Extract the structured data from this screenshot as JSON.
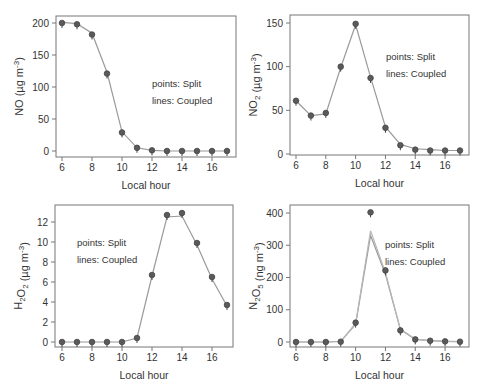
{
  "figure": {
    "layout": "2x2 grid",
    "colors": {
      "frame": "#777777",
      "text": "#333333",
      "line": "#9a9a9a",
      "point_fill": "#5a5a5a",
      "point_edge": "#444444"
    }
  },
  "chart_data": [
    {
      "id": "no",
      "type": "line",
      "title": "",
      "ylabel": "NO (µg m⁻³)",
      "ylabel_parts": {
        "species": "NO",
        "sub": "",
        "unit": " (µg m",
        "exp": "-3",
        "close": ")"
      },
      "xlabel": "Local hour",
      "x": [
        6,
        7,
        8,
        9,
        10,
        11,
        12,
        13,
        14,
        15,
        16,
        17
      ],
      "xticks": [
        6,
        8,
        10,
        12,
        14,
        16
      ],
      "yticks": [
        0,
        50,
        100,
        150,
        200
      ],
      "xlim": [
        6,
        17
      ],
      "ylim": [
        0,
        200
      ],
      "series": [
        {
          "name": "Split",
          "style": "points",
          "values": [
            200,
            198,
            182,
            121,
            29,
            5,
            1,
            0,
            0,
            0,
            0,
            0
          ]
        },
        {
          "name": "Coupled",
          "style": "lines",
          "values": [
            201,
            199,
            184,
            123,
            30,
            5,
            1,
            0,
            0,
            0,
            0,
            0
          ]
        }
      ],
      "annotations": [
        "points: Split",
        "lines: Coupled"
      ],
      "annotation_pos": {
        "x": 152,
        "y": 87
      },
      "grid": false,
      "frame": {
        "left": 56,
        "top": 16,
        "right": 236,
        "bottom": 157
      },
      "px": {
        "x0": 62,
        "x1": 227,
        "y0": 151,
        "y1": 23
      }
    },
    {
      "id": "no2",
      "type": "line",
      "title": "",
      "ylabel": "NO₂ (µg m⁻³)",
      "ylabel_parts": {
        "species": "NO",
        "sub": "2",
        "unit": " (µg m",
        "exp": "-3",
        "close": ")"
      },
      "xlabel": "Local hour",
      "x": [
        6,
        7,
        8,
        9,
        10,
        11,
        12,
        13,
        14,
        15,
        16,
        17
      ],
      "xticks": [
        6,
        8,
        10,
        12,
        14,
        16
      ],
      "yticks": [
        0,
        50,
        100,
        150
      ],
      "xlim": [
        6,
        17
      ],
      "ylim": [
        0,
        150
      ],
      "series": [
        {
          "name": "Split",
          "style": "points",
          "values": [
            61,
            44,
            47,
            100,
            149,
            87,
            30,
            10,
            5,
            4,
            4,
            4
          ]
        },
        {
          "name": "Coupled",
          "style": "lines",
          "values": [
            61,
            44,
            46,
            99,
            148,
            88,
            31,
            11,
            6,
            5,
            4,
            4
          ]
        }
      ],
      "annotations": [
        "points: Split",
        "lines: Coupled"
      ],
      "annotation_pos": {
        "x": 386,
        "y": 60
      },
      "grid": false,
      "frame": {
        "left": 290,
        "top": 15,
        "right": 469,
        "bottom": 155
      },
      "px": {
        "x0": 296,
        "x1": 460,
        "y0": 154,
        "y1": 23
      }
    },
    {
      "id": "h2o2",
      "type": "line",
      "title": "",
      "ylabel": "H₂O₂ (µg m⁻³)",
      "ylabel_parts": {
        "species": "H",
        "sub": "2",
        "species2": "O",
        "sub2": "2",
        "unit": " (µg m",
        "exp": "-3",
        "close": ")"
      },
      "xlabel": "Local hour",
      "x": [
        6,
        7,
        8,
        9,
        10,
        11,
        12,
        13,
        14,
        15,
        16,
        17
      ],
      "xticks": [
        6,
        8,
        10,
        12,
        14,
        16
      ],
      "yticks": [
        0,
        2,
        4,
        6,
        8,
        10,
        12
      ],
      "xlim": [
        6,
        17
      ],
      "ylim": [
        0,
        12
      ],
      "series": [
        {
          "name": "Split",
          "style": "points",
          "values": [
            0,
            0,
            0,
            0,
            0,
            0.4,
            6.7,
            12.7,
            12.9,
            9.9,
            6.5,
            3.7
          ]
        },
        {
          "name": "Coupled",
          "style": "lines",
          "values": [
            0,
            0,
            0,
            0,
            0,
            0.4,
            6.6,
            12.5,
            12.6,
            9.7,
            6.3,
            3.6
          ]
        }
      ],
      "annotations": [
        "points: Split",
        "lines: Coupled"
      ],
      "annotation_pos": {
        "x": 77,
        "y": 246
      },
      "grid": false,
      "frame": {
        "left": 55,
        "top": 205,
        "right": 233,
        "bottom": 347
      },
      "px": {
        "x0": 62,
        "x1": 227,
        "y0": 342,
        "y1": 222
      }
    },
    {
      "id": "n2o5",
      "type": "line",
      "title": "",
      "ylabel": "N₂O₅ (ng m⁻³)",
      "ylabel_parts": {
        "species": "N",
        "sub": "2",
        "species2": "O",
        "sub2": "5",
        "unit": " (ng m",
        "exp": "-3",
        "close": ")"
      },
      "xlabel": "Local hour",
      "x": [
        6,
        7,
        8,
        9,
        10,
        11,
        12,
        13,
        14,
        15,
        16,
        17
      ],
      "xticks": [
        6,
        8,
        10,
        12,
        14,
        16
      ],
      "yticks": [
        0,
        100,
        200,
        300,
        400
      ],
      "xlim": [
        6,
        17
      ],
      "ylim": [
        0,
        400
      ],
      "series": [
        {
          "name": "Split",
          "style": "points",
          "values": [
            0,
            0,
            0,
            1,
            60,
            402,
            222,
            36,
            8,
            4,
            2,
            1
          ]
        },
        {
          "name": "Coupled",
          "style": "lines",
          "values": [
            0,
            0,
            0,
            2,
            55,
            330,
            210,
            38,
            8,
            4,
            2,
            1
          ]
        },
        {
          "name": "Coupled-alt",
          "style": "lines",
          "values": [
            0,
            0,
            0,
            2,
            58,
            345,
            215,
            40,
            9,
            4,
            2,
            1
          ]
        }
      ],
      "annotations": [
        "points: Split",
        "lines: Coupled"
      ],
      "annotation_pos": {
        "x": 385,
        "y": 248
      },
      "grid": false,
      "frame": {
        "left": 290,
        "top": 205,
        "right": 469,
        "bottom": 347
      },
      "px": {
        "x0": 296,
        "x1": 460,
        "y0": 342,
        "y1": 213
      }
    }
  ]
}
